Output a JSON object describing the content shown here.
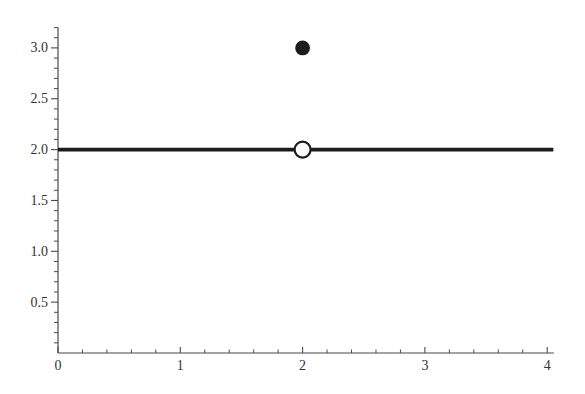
{
  "chart_data": {
    "type": "line",
    "title": "",
    "xlabel": "",
    "ylabel": "",
    "xlim": [
      0,
      4.05
    ],
    "ylim": [
      0,
      3.2
    ],
    "grid": false,
    "legend": null,
    "x_axis": {
      "major_ticks": [
        0,
        1,
        2,
        3,
        4
      ],
      "major_tick_labels": [
        "0",
        "1",
        "2",
        "3",
        "4"
      ],
      "minor_tick_step": 0.2,
      "tick_direction": "up"
    },
    "y_axis": {
      "major_ticks": [
        0.5,
        1.0,
        1.5,
        2.0,
        2.5,
        3.0
      ],
      "major_tick_labels": [
        "0.5",
        "1.0",
        "1.5",
        "2.0",
        "2.5",
        "3.0"
      ],
      "minor_tick_step": 0.1,
      "tick_direction": "left"
    },
    "series": [
      {
        "name": "constant-line",
        "description": "horizontal line segment y = 2",
        "y": 2,
        "x_start": 0,
        "x_end": 4.05,
        "stroke_width": 3.8
      }
    ],
    "points": [
      {
        "name": "filled-point",
        "x": 2,
        "y": 3,
        "style": "filled",
        "radius": 7.4
      },
      {
        "name": "open-point",
        "x": 2,
        "y": 2,
        "style": "open",
        "radius": 8,
        "stroke_width": 2.2
      }
    ],
    "colors": {
      "ink": "#1c1c1c",
      "axis": "#4a4a4a",
      "label": "#333333",
      "background": "#ffffff",
      "open_point_fill": "#ffffff"
    }
  }
}
